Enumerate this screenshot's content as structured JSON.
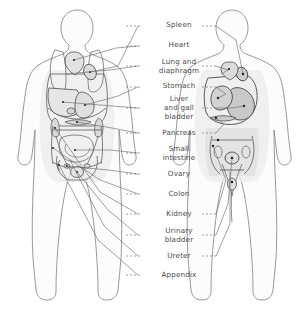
{
  "diagram": {
    "background_color": "#ffffff",
    "outline_color": "#8d8d8d",
    "organ_line_color": "#5b5b5b",
    "leader_color": "#6e6e6e",
    "label_color": "#4a4a4a",
    "shade_color": "#d9d9d9",
    "marker_color": "#1a1a1a",
    "figures": [
      {
        "name": "front-view-figure-left",
        "side": "left"
      },
      {
        "name": "front-view-figure-right",
        "side": "right"
      }
    ],
    "labels": [
      {
        "id": "spleen",
        "text": "Spleen",
        "x": 142,
        "y": 24,
        "dash_left": true,
        "dash_right": true
      },
      {
        "id": "heart",
        "text": "Heart",
        "x": 142,
        "y": 44,
        "dash_left": true,
        "dash_right": false
      },
      {
        "id": "lung-diaphragm",
        "text": "Lung and\ndiaphragm",
        "x": 142,
        "y": 60,
        "dash_left": true,
        "dash_right": true
      },
      {
        "id": "stomach",
        "text": "Stomach",
        "x": 142,
        "y": 85,
        "dash_left": true,
        "dash_right": true
      },
      {
        "id": "liver-gall",
        "text": "Liver\nand gall\nbladder",
        "x": 142,
        "y": 101,
        "dash_left": true,
        "dash_right": true
      },
      {
        "id": "pancreas",
        "text": "Pancreas",
        "x": 142,
        "y": 131,
        "dash_left": true,
        "dash_right": true
      },
      {
        "id": "small-intestine",
        "text": "Small\nintestine",
        "x": 142,
        "y": 147,
        "dash_left": true,
        "dash_right": false
      },
      {
        "id": "ovary",
        "text": "Ovary",
        "x": 142,
        "y": 172,
        "dash_left": true,
        "dash_right": false
      },
      {
        "id": "colon",
        "text": "Colon",
        "x": 142,
        "y": 192,
        "dash_left": true,
        "dash_right": false
      },
      {
        "id": "kidney",
        "text": "Kidney",
        "x": 142,
        "y": 212,
        "dash_left": true,
        "dash_right": true
      },
      {
        "id": "urinary-bladder",
        "text": "Urinary\nbladder",
        "x": 142,
        "y": 229,
        "dash_left": true,
        "dash_right": true
      },
      {
        "id": "ureter",
        "text": "Ureter",
        "x": 142,
        "y": 254,
        "dash_left": true,
        "dash_right": true
      },
      {
        "id": "appendix",
        "text": "Appendix",
        "x": 142,
        "y": 273,
        "dash_left": true,
        "dash_right": false
      }
    ]
  }
}
